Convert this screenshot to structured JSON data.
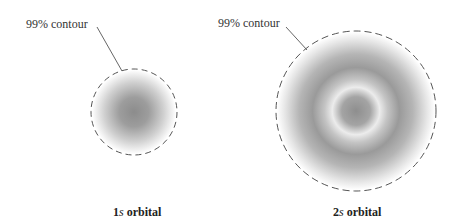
{
  "figure": {
    "orbitals": [
      {
        "id": "1s",
        "label_number": "1",
        "label_letter": "s",
        "label_suffix": " orbital",
        "contour_label": "99% contour",
        "center": [
          134,
          112
        ],
        "radius": 43
      },
      {
        "id": "2s",
        "label_number": "2",
        "label_letter": "s",
        "label_suffix": " orbital",
        "contour_label": "99% contour",
        "center": [
          356,
          111
        ],
        "radius": 80
      }
    ],
    "colors": {
      "contour": "#555555",
      "shade_dark": "#8a8a8a",
      "background": "#ffffff"
    }
  }
}
